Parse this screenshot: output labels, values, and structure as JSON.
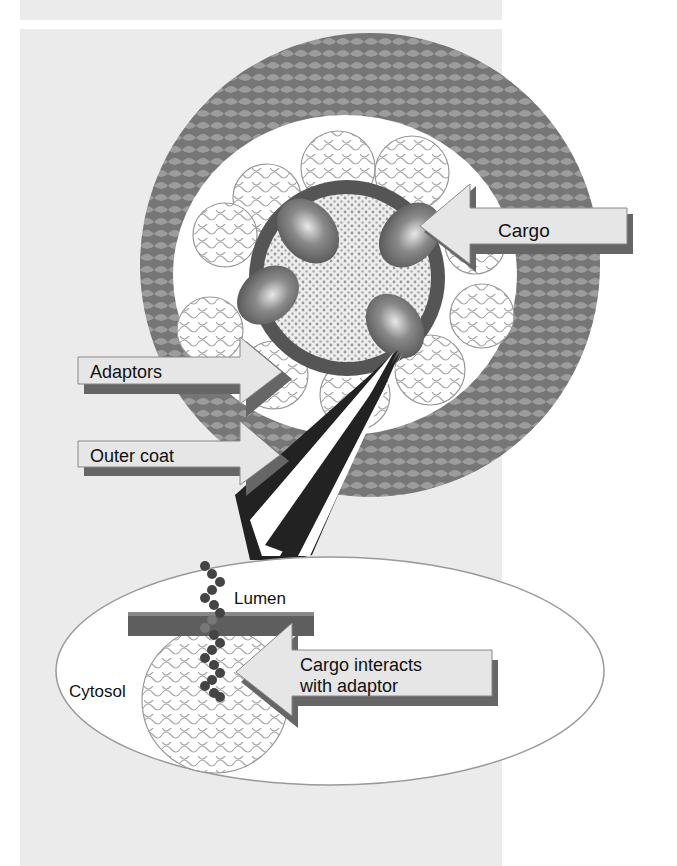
{
  "figure": {
    "labels": {
      "cargo": "Cargo",
      "adaptors": "Adaptors",
      "outer_coat": "Outer coat",
      "lumen": "Lumen",
      "cytosol": "Cytosol",
      "cargo_interacts_line1": "Cargo interacts",
      "cargo_interacts_line2": "with adaptor"
    },
    "colors": {
      "background_panel": "#ebebeb",
      "outer_coat": "#7a7a7a",
      "outer_coat_scale": "#9c9c9c",
      "inner_white": "#ffffff",
      "membrane_ring": "#555555",
      "core_dots": "#9a9a9a",
      "cargo_blob": "#777777",
      "arrow_fill": "#e6e6e6",
      "arrow_shadow": "#666666",
      "membrane_bar": "#5e5e5e",
      "bead": "#444444"
    }
  }
}
